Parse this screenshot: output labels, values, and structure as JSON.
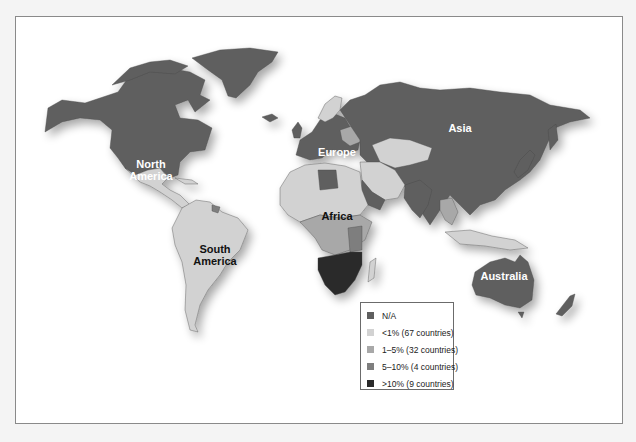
{
  "map": {
    "subject": "World map, countries shaded by percentage category",
    "colors": {
      "na": "#5f5f5f",
      "lt1": "#d2d2d2",
      "1to5": "#a8a8a8",
      "5to10": "#7e7e7e",
      "gt10": "#2a2a2a",
      "background": "#ffffff",
      "frame": "#8a8a8a"
    },
    "labels": {
      "north_america": "North\nAmerica",
      "south_america": "South\nAmerica",
      "europe": "Europe",
      "asia": "Asia",
      "africa": "Africa",
      "australia": "Australia"
    }
  },
  "legend": {
    "items": [
      {
        "label": "N/A",
        "color": "#5f5f5f"
      },
      {
        "label": "<1% (67 countries)",
        "color": "#d2d2d2"
      },
      {
        "label": "1–5% (32 countries)",
        "color": "#a8a8a8"
      },
      {
        "label": "5–10% (4 countries)",
        "color": "#7e7e7e"
      },
      {
        "label": ">10% (9 countries)",
        "color": "#2a2a2a"
      }
    ]
  }
}
